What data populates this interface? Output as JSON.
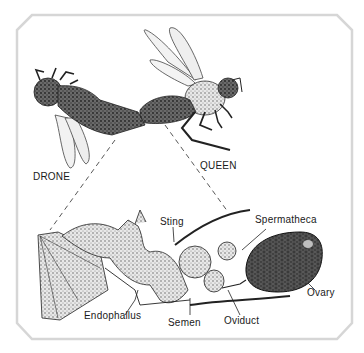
{
  "figure": {
    "frame_color": "#d6d6d6",
    "labels": {
      "drone": "DRONE",
      "queen": "QUEEN",
      "sting": "Sting",
      "spermatheca": "Spermatheca",
      "ovary": "Ovary",
      "endophallus": "Endophallus",
      "semen": "Semen",
      "oviduct": "Oviduct"
    }
  }
}
